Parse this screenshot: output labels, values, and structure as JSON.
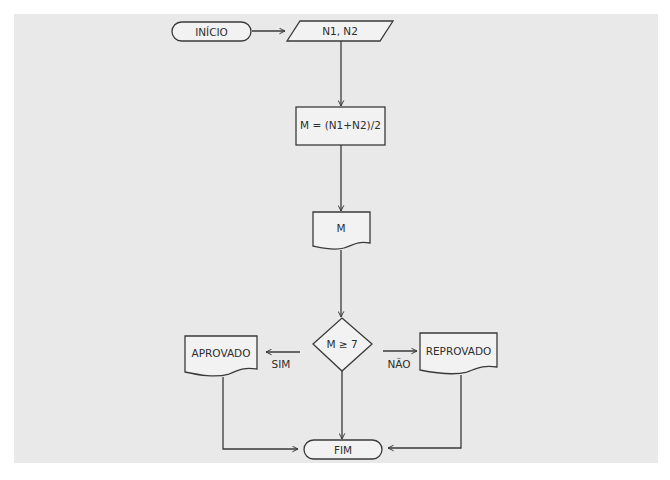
{
  "diagram": {
    "type": "flowchart",
    "nodes": {
      "start": {
        "kind": "terminal",
        "label": "INÍCIO"
      },
      "input": {
        "kind": "input",
        "label": "N1, N2"
      },
      "process": {
        "kind": "process",
        "label": "M = (N1+N2)/2"
      },
      "output_m": {
        "kind": "document",
        "label": "M"
      },
      "decision": {
        "kind": "decision",
        "label": "M ≥ 7"
      },
      "approved": {
        "kind": "document",
        "label": "APROVADO"
      },
      "failed": {
        "kind": "document",
        "label": "REPROVADO"
      },
      "end": {
        "kind": "terminal",
        "label": "FIM"
      }
    },
    "edges": {
      "yes_label": "SIM",
      "no_label": "NÃO"
    },
    "connections": [
      {
        "from": "start",
        "to": "input"
      },
      {
        "from": "input",
        "to": "process"
      },
      {
        "from": "process",
        "to": "output_m"
      },
      {
        "from": "output_m",
        "to": "decision"
      },
      {
        "from": "decision",
        "to": "approved",
        "label": "SIM"
      },
      {
        "from": "decision",
        "to": "failed",
        "label": "NÃO"
      },
      {
        "from": "decision",
        "to": "end"
      },
      {
        "from": "approved",
        "to": "end"
      },
      {
        "from": "failed",
        "to": "end"
      }
    ]
  }
}
